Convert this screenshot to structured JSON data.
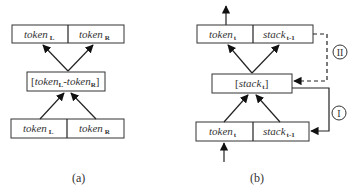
{
  "figure_a": {
    "caption": "(a)",
    "top_box": {
      "left": {
        "text": "token",
        "sub": "L"
      },
      "right": {
        "text": "token",
        "sub": "R"
      }
    },
    "middle_box": {
      "open": "[",
      "left": {
        "text": "token",
        "sub": "L"
      },
      "sep": "-",
      "right": {
        "text": "token",
        "sub": "R"
      },
      "close": "]"
    },
    "bottom_box": {
      "left": {
        "text": "token",
        "sub": "L"
      },
      "right": {
        "text": "token",
        "sub": "R"
      }
    }
  },
  "figure_b": {
    "caption": "(b)",
    "top_box": {
      "left": {
        "text": "token",
        "sub": "t"
      },
      "right": {
        "text": "stack",
        "sub": "t-1"
      }
    },
    "middle_box": {
      "open": "[",
      "text": "stack",
      "sub": "t",
      "close": "]"
    },
    "bottom_box": {
      "left": {
        "text": "token",
        "sub": "t"
      },
      "right": {
        "text": "stack",
        "sub": "t-1"
      }
    },
    "connector_dashed_label": "II",
    "connector_solid_label": "I"
  }
}
